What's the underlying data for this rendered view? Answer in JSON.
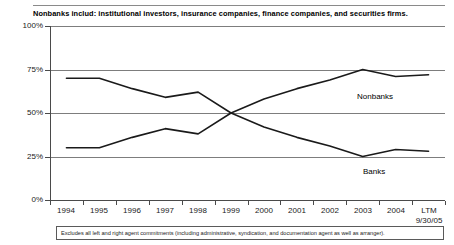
{
  "header": {
    "title": "Nonbanks includ: institutional investors, insurance companies, finance companies, and securities firms."
  },
  "footnote": {
    "text": "Excludes all left and right agent commitments (including administrative, syndication, and documentation agent as well as arranger)."
  },
  "labels": {
    "nonbanks": "Nonbanks",
    "banks": "Banks"
  },
  "axis": {
    "y_ticks": [
      "100%",
      "75%",
      "50%",
      "25%",
      "0%"
    ],
    "x_ticks": [
      {
        "main": "1994",
        "sub": ""
      },
      {
        "main": "1995",
        "sub": ""
      },
      {
        "main": "1996",
        "sub": ""
      },
      {
        "main": "1997",
        "sub": ""
      },
      {
        "main": "1998",
        "sub": ""
      },
      {
        "main": "1999",
        "sub": ""
      },
      {
        "main": "2000",
        "sub": ""
      },
      {
        "main": "2001",
        "sub": ""
      },
      {
        "main": "2002",
        "sub": ""
      },
      {
        "main": "2003",
        "sub": ""
      },
      {
        "main": "2004",
        "sub": ""
      },
      {
        "main": "LTM",
        "sub": "9/30/05"
      }
    ]
  },
  "colors": {
    "line": "#1a1a1a",
    "grid": "#7d7d7d",
    "axis": "#4a4a4a"
  },
  "chart_data": {
    "type": "line",
    "title": "Nonbanks includ: institutional investors, insurance companies, finance companies, and securities firms.",
    "xlabel": "",
    "ylabel": "",
    "ylim": [
      0,
      100
    ],
    "yticks": [
      0,
      25,
      50,
      75,
      100
    ],
    "grid": true,
    "legend": "inline-labels",
    "categories": [
      "1994",
      "1995",
      "1996",
      "1997",
      "1998",
      "1999",
      "2000",
      "2001",
      "2002",
      "2003",
      "2004",
      "LTM 9/30/05"
    ],
    "series": [
      {
        "name": "Banks",
        "values": [
          70,
          70,
          64,
          59,
          62,
          50,
          42,
          36,
          31,
          25,
          29,
          28
        ]
      },
      {
        "name": "Nonbanks",
        "values": [
          30,
          30,
          36,
          41,
          38,
          50,
          58,
          64,
          69,
          75,
          71,
          72
        ]
      }
    ],
    "annotations": [
      {
        "text": "Nonbanks",
        "x": "2002",
        "y": 64
      },
      {
        "text": "Banks",
        "x": "2002",
        "y": 20
      }
    ],
    "footnote": "Excludes all left and right agent commitments (including administrative, syndication, and documentation agent as well as arranger)."
  }
}
